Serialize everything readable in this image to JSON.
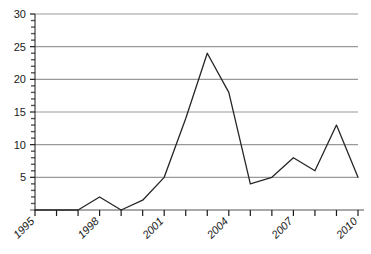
{
  "chart_data": {
    "type": "line",
    "title": "",
    "xlabel": "",
    "ylabel": "",
    "x": [
      1995,
      1996,
      1997,
      1998,
      1999,
      2000,
      2001,
      2002,
      2003,
      2004,
      2005,
      2006,
      2007,
      2008,
      2009,
      2010
    ],
    "values": [
      0,
      0,
      0,
      2,
      0,
      1.5,
      5,
      14,
      24,
      18,
      4,
      5,
      8,
      6,
      13,
      5
    ],
    "series": [
      {
        "name": "series-1",
        "values": [
          0,
          0,
          0,
          2,
          0,
          1.5,
          5,
          14,
          24,
          18,
          4,
          5,
          8,
          6,
          13,
          5
        ],
        "color": "#262626"
      }
    ],
    "xlim": [
      1995,
      2010
    ],
    "ylim": [
      0,
      30
    ],
    "ytick_values": [
      5,
      10,
      15,
      20,
      25,
      30
    ],
    "ytick_labels": [
      "5",
      "10",
      "15",
      "20",
      "25",
      "30"
    ],
    "xtick_values": [
      1995,
      1996,
      1997,
      1998,
      1999,
      2000,
      2001,
      2002,
      2003,
      2004,
      2005,
      2006,
      2007,
      2008,
      2009,
      2010
    ],
    "xtick_labels_shown": [
      "1995",
      "1998",
      "2001",
      "2004",
      "2007",
      "2010"
    ],
    "xtick_labels_shown_values": [
      1995,
      1998,
      2001,
      2004,
      2007,
      2010
    ],
    "xtick_label_rotation": 45,
    "grid": {
      "horizontal": true,
      "vertical": false,
      "color": "#999999"
    },
    "minor_yticks": true,
    "legend": null,
    "legend_position": "none"
  },
  "axes": {
    "y_axis_name": "y-axis",
    "x_axis_name": "x-axis"
  },
  "colors": {
    "line": "#262626",
    "grid": "#999999",
    "axis": "#1a1a1a",
    "background": "#ffffff",
    "tick_label": "#1a1a1a"
  }
}
